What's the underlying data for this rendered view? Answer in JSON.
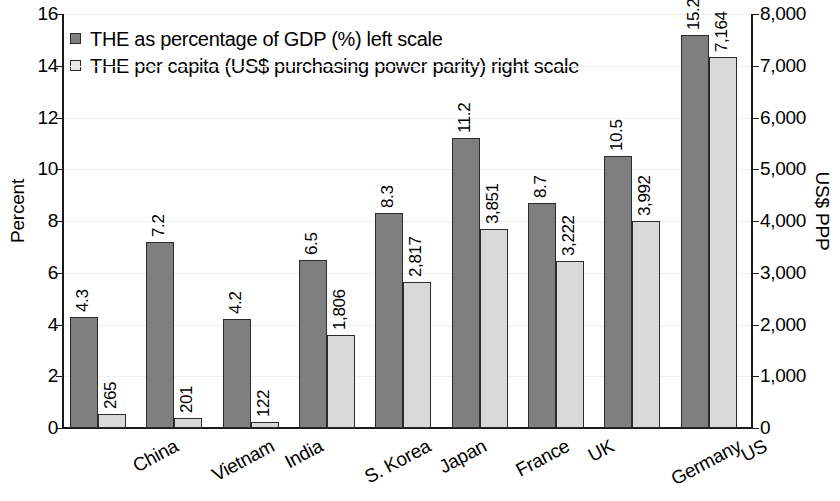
{
  "chart_data": {
    "type": "bar",
    "title": "",
    "xlabel": "",
    "ylabel": "Percent",
    "y2label": "US$ PPP",
    "ylim": [
      0,
      16
    ],
    "y2lim": [
      0,
      8000
    ],
    "yticks": [
      "0",
      "2",
      "4",
      "6",
      "8",
      "10",
      "12",
      "14",
      "16"
    ],
    "y2ticks": [
      "0",
      "1,000",
      "2,000",
      "3,000",
      "4,000",
      "5,000",
      "6,000",
      "7,000",
      "8,000"
    ],
    "grid": true,
    "legend_position": "top-left",
    "categories": [
      "China",
      "Vietnam",
      "India",
      "S. Korea",
      "Japan",
      "France",
      "UK",
      "Germany",
      "US"
    ],
    "series": [
      {
        "name": "THE as percentage of GDP (%) left scale",
        "axis": "left",
        "color": "#7f7f7f",
        "values": [
          4.3,
          7.2,
          4.2,
          6.5,
          8.3,
          11.2,
          8.7,
          10.5,
          15.2
        ],
        "labels": [
          "4.3",
          "7.2",
          "4.2",
          "6.5",
          "8.3",
          "11.2",
          "8.7",
          "10.5",
          "15.2"
        ]
      },
      {
        "name": "THE per capita (US$ purchasing power parity) right scale",
        "axis": "right",
        "color": "#d9d9d9",
        "values": [
          265,
          201,
          122,
          1806,
          2817,
          3851,
          3222,
          3992,
          7164
        ],
        "labels": [
          "265",
          "201",
          "122",
          "1,806",
          "2,817",
          "3,851",
          "3,222",
          "3,992",
          "7,164"
        ]
      }
    ]
  }
}
